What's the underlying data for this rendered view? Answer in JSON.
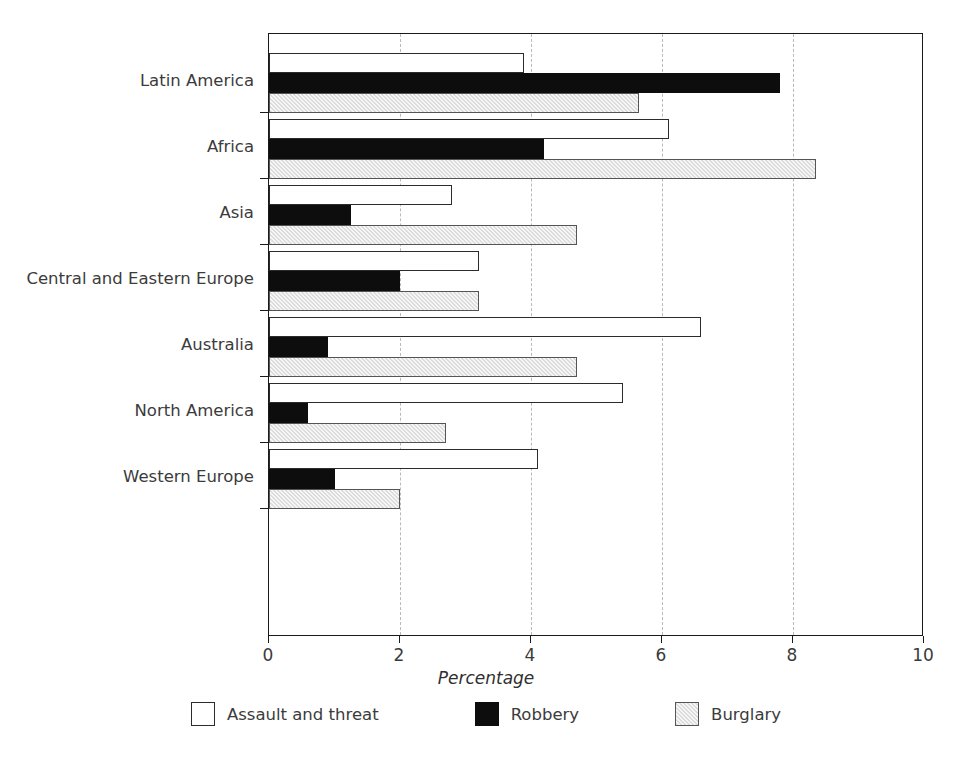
{
  "chart_data": {
    "type": "bar",
    "orientation": "horizontal",
    "title": "",
    "xlabel": "Percentage",
    "ylabel": "",
    "xlim": [
      0,
      10
    ],
    "xticks": [
      0,
      2,
      4,
      6,
      8,
      10
    ],
    "grid": "vertical-dashed",
    "legend_position": "bottom",
    "categories": [
      "Latin America",
      "Africa",
      "Asia",
      "Central and Eastern Europe",
      "Australia",
      "North America",
      "Western Europe"
    ],
    "series": [
      {
        "name": "Assault and threat",
        "color": "#ffffff",
        "values": [
          3.9,
          6.1,
          2.8,
          3.2,
          6.6,
          5.4,
          4.1
        ]
      },
      {
        "name": "Robbery",
        "color": "#0d0d0d",
        "values": [
          7.8,
          4.2,
          1.25,
          2.0,
          0.9,
          0.6,
          1.0
        ]
      },
      {
        "name": "Burglary",
        "color": "#dcdcdc",
        "values": [
          5.65,
          8.35,
          4.7,
          3.2,
          4.7,
          2.7,
          2.0
        ]
      }
    ]
  }
}
